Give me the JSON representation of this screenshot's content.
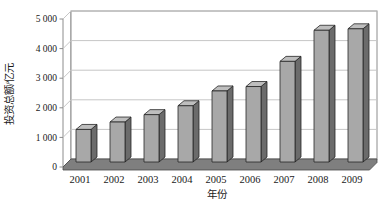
{
  "chart_data": {
    "type": "bar",
    "title": "",
    "xlabel": "年份",
    "ylabel": "投资总额/亿元",
    "categories": [
      "2001",
      "2002",
      "2003",
      "2004",
      "2005",
      "2006",
      "2007",
      "2008",
      "2009"
    ],
    "values": [
      1100,
      1350,
      1600,
      1900,
      2400,
      2550,
      3400,
      4450,
      4500
    ],
    "ylim": [
      0,
      5000
    ],
    "ytick_values": [
      0,
      1000,
      2000,
      3000,
      4000,
      5000
    ],
    "ytick_labels": [
      "0",
      "1 000",
      "2 000",
      "3 000",
      "4 000",
      "5 000"
    ],
    "grid": true,
    "legend_position": "none",
    "style": "excel-3d-column",
    "colors": {
      "bar_front": "#a8a8a8",
      "bar_top": "#bebebe",
      "bar_side": "#6b6b6b",
      "bar_outline": "#262626",
      "floor": "#7f7f7f",
      "floor_outline": "#4a4a4a",
      "wall_fill": "#ffffff",
      "wall_edge": "#8c8c8c",
      "gridline": "#c6c6c6",
      "text": "#1a1a1a"
    }
  }
}
